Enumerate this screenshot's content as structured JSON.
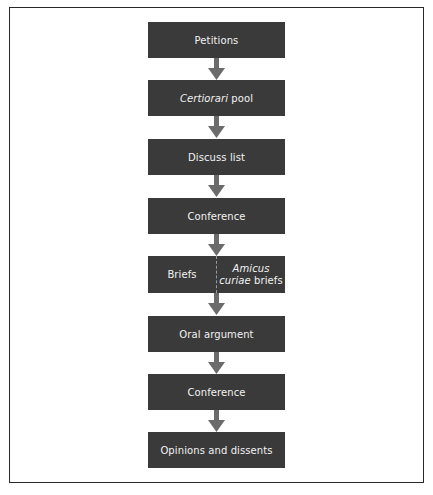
{
  "diagram": {
    "type": "flowchart",
    "direction": "top-to-bottom",
    "colors": {
      "box_fill": "#3a3a3a",
      "box_text": "#f2f2f2",
      "arrow": "#6b6b6b",
      "frame": "#2a2a2a",
      "divider": "#9a9a9a"
    },
    "steps": [
      {
        "label": "Petitions"
      },
      {
        "label_italic": "Certiorari",
        "label_rest": " pool"
      },
      {
        "label": "Discuss list"
      },
      {
        "label": "Conference"
      },
      {
        "left": {
          "label": "Briefs"
        },
        "right": {
          "label_italic": "Amicus curiae",
          "label_rest": " briefs"
        }
      },
      {
        "label": "Oral argument"
      },
      {
        "label": "Conference"
      },
      {
        "label": "Opinions and dissents"
      }
    ],
    "edges": [
      {
        "from": 0,
        "to": 1
      },
      {
        "from": 1,
        "to": 2
      },
      {
        "from": 2,
        "to": 3
      },
      {
        "from": 3,
        "to": 4
      },
      {
        "from": 4,
        "to": 5
      },
      {
        "from": 5,
        "to": 6
      },
      {
        "from": 6,
        "to": 7
      }
    ]
  }
}
